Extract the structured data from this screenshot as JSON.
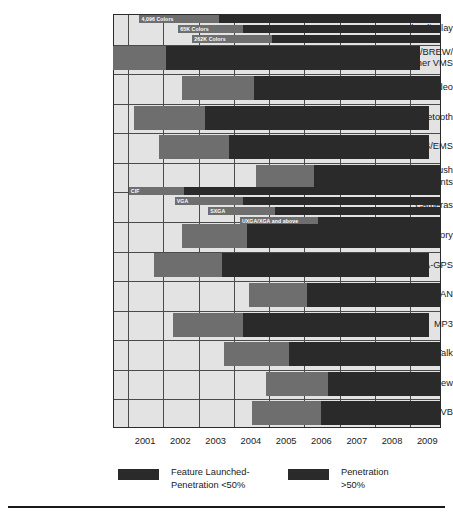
{
  "chart_data": {
    "type": "bar",
    "chart_style": "gantt-timeline",
    "title": "",
    "xlabel": "",
    "ylabel": "",
    "xlim": [
      2000.6,
      2009.9
    ],
    "grid": true,
    "legend_position": "bottom",
    "tick_labels": [
      "2001",
      "2002",
      "2003",
      "2004",
      "2005",
      "2006",
      "2007",
      "2008",
      "2009"
    ],
    "legend": [
      {
        "key": "launched",
        "color": "#2a2a2a",
        "label_line1": "Feature Launched-",
        "label_line2": "Penetration <50%"
      },
      {
        "key": "penetration",
        "color": "#2a2a2a",
        "label_line1": "Penetration",
        "label_line2": ">50%"
      }
    ],
    "colors": {
      "launched": "#6e6e6e",
      "penetration": "#2a2a2a",
      "plot_background": "#e3e3e3",
      "grid": "#4a4a4a"
    },
    "categories": [
      {
        "label_lines": [
          "Color display"
        ],
        "bars": [
          {
            "bar_label": "4,096 Colors",
            "start": 2001.35,
            "launch_end": 2003.6,
            "end": 2009.9
          },
          {
            "bar_label": "65K Colors",
            "start": 2002.45,
            "launch_end": 2004.3,
            "end": 2009.9
          },
          {
            "bar_label": "262K Colors",
            "start": 2002.85,
            "launch_end": 2005.1,
            "end": 2009.9
          }
        ]
      },
      {
        "label_lines": [
          "Java/BREW/",
          "other VMS"
        ],
        "bars": [
          {
            "bar_label": "",
            "start": 2000.6,
            "launch_end": 2002.1,
            "end": 2009.3
          }
        ]
      },
      {
        "label_lines": [
          "Streaming video"
        ],
        "bars": [
          {
            "bar_label": "",
            "start": 2002.55,
            "launch_end": 2004.6,
            "end": 2009.9
          }
        ]
      },
      {
        "label_lines": [
          "Bluetooth"
        ],
        "bars": [
          {
            "bar_label": "",
            "start": 2001.2,
            "launch_end": 2003.2,
            "end": 2009.55
          }
        ]
      },
      {
        "label_lines": [
          "MMS/EMS"
        ],
        "bars": [
          {
            "bar_label": "",
            "start": 2001.9,
            "launch_end": 2003.9,
            "end": 2009.55
          }
        ]
      },
      {
        "label_lines": [
          "E-mail – Push",
          "& Attachments"
        ],
        "bars": [
          {
            "bar_label": "",
            "start": 2004.65,
            "launch_end": 2006.3,
            "end": 2009.9
          }
        ]
      },
      {
        "label_lines": [
          "Cameras"
        ],
        "bars": [
          {
            "bar_label": "CIF",
            "start": 2001.05,
            "launch_end": 2002.6,
            "end": 2009.9
          },
          {
            "bar_label": "VGA",
            "start": 2002.35,
            "launch_end": 2004.3,
            "end": 2009.9
          },
          {
            "bar_label": "SXGA",
            "start": 2003.3,
            "launch_end": 2005.2,
            "end": 2009.9
          },
          {
            "bar_label": "UXGA/XGA and above",
            "start": 2004.2,
            "launch_end": 2006.4,
            "end": 2009.9
          }
        ]
      },
      {
        "label_lines": [
          "Slot in Memory"
        ],
        "bars": [
          {
            "bar_label": "",
            "start": 2002.55,
            "launch_end": 2004.4,
            "end": 2009.9
          }
        ]
      },
      {
        "label_lines": [
          "GPS/A-GPS"
        ],
        "bars": [
          {
            "bar_label": "",
            "start": 2001.75,
            "launch_end": 2003.7,
            "end": 2009.55
          }
        ]
      },
      {
        "label_lines": [
          "WLAN"
        ],
        "bars": [
          {
            "bar_label": "",
            "start": 2004.45,
            "launch_end": 2006.1,
            "end": 2009.9
          }
        ]
      },
      {
        "label_lines": [
          "MP3"
        ],
        "bars": [
          {
            "bar_label": "",
            "start": 2002.3,
            "launch_end": 2004.3,
            "end": 2009.55
          }
        ]
      },
      {
        "label_lines": [
          "Push-to-Talk"
        ],
        "bars": [
          {
            "bar_label": "",
            "start": 2003.75,
            "launch_end": 2005.6,
            "end": 2009.9
          }
        ]
      },
      {
        "label_lines": [
          "Push-to-View"
        ],
        "bars": [
          {
            "bar_label": "",
            "start": 2004.95,
            "launch_end": 2006.7,
            "end": 2009.9
          }
        ]
      },
      {
        "label_lines": [
          "DAB/DVB"
        ],
        "bars": [
          {
            "bar_label": "",
            "start": 2004.55,
            "launch_end": 2006.5,
            "end": 2009.9
          }
        ]
      }
    ]
  }
}
